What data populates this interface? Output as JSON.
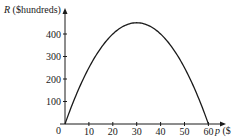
{
  "chart_data": {
    "type": "line",
    "title": "",
    "xlabel": "p ($",
    "xlabel_var": "p",
    "xlabel_unit": " ($",
    "ylabel": "R ($hundreds)",
    "ylabel_var": "R",
    "ylabel_unit": " ($hundreds)",
    "xlim": [
      0,
      60
    ],
    "ylim": [
      0,
      450
    ],
    "x_ticks": [
      "10",
      "20",
      "30",
      "40",
      "50",
      "60"
    ],
    "y_ticks": [
      "100",
      "200",
      "300",
      "400"
    ],
    "origin_label": "0",
    "grid": false,
    "legend": null,
    "series": [
      {
        "name": "R = p(60 - p)/2",
        "x": [
          0,
          5,
          10,
          15,
          20,
          25,
          30,
          35,
          40,
          45,
          50,
          55,
          60
        ],
        "y": [
          0,
          137.5,
          250,
          337.5,
          400,
          437.5,
          450,
          437.5,
          400,
          337.5,
          250,
          137.5,
          0
        ]
      }
    ],
    "colors": {
      "curve": "#1a1a1a",
      "axes": "#1a1a1a"
    }
  }
}
